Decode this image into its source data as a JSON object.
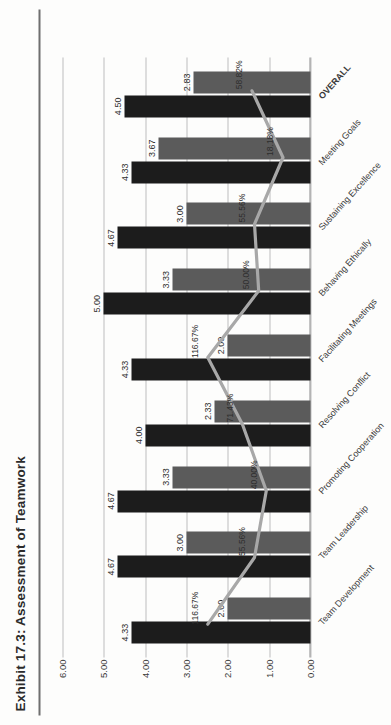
{
  "title": "Exhibit 17.3:  Assessment of Teamwork",
  "axis": {
    "y_ticks": [
      "6.00",
      "5.00",
      "4.00",
      "3.00",
      "2.00",
      "1.00",
      "0.00"
    ]
  },
  "colors": {
    "series_dark": "#1c1c1c",
    "series_mid": "#5b5b5b",
    "line": "#a8a8a8",
    "grid": "#bdbdbd",
    "axis": "#8c8c8c",
    "text": "#2e2e2e",
    "rule": "#6f6f6f",
    "background": "#fdfdfc"
  },
  "chart_data": {
    "type": "bar",
    "title": "Exhibit 17.3:  Assessment of Teamwork",
    "xlabel": "",
    "ylabel": "",
    "ylim": [
      0,
      6
    ],
    "grid": true,
    "legend": "none",
    "categories": [
      "Team Development",
      "Team Leadership",
      "Promoting Cooperation",
      "Resolving Conflict",
      "Facilitating Meetings",
      "Behaving Ethically",
      "Sustaining Excellence",
      "Meeting Goals",
      "OVERALL"
    ],
    "series": [
      {
        "name": "dark-bars",
        "color": "#1c1c1c",
        "values": [
          4.33,
          4.67,
          4.67,
          4.0,
          4.33,
          5.0,
          4.67,
          4.33,
          4.5
        ],
        "labels": [
          "4.33",
          "4.67",
          "4.67",
          "4.00",
          "4.33",
          "5.00",
          "4.67",
          "4.33",
          "4.50"
        ]
      },
      {
        "name": "mid-bars",
        "color": "#5b5b5b",
        "values": [
          2.0,
          3.0,
          3.33,
          2.33,
          2.0,
          3.33,
          3.0,
          3.67,
          2.83
        ],
        "labels": [
          "2.00",
          "3.00",
          "3.33",
          "2.33",
          "2.00",
          "3.33",
          "3.00",
          "3.67",
          "2.83"
        ]
      }
    ],
    "line_series": {
      "name": "percent-line",
      "color": "#a8a8a8",
      "values": [
        116.67,
        55.56,
        40.0,
        71.43,
        116.67,
        50.0,
        55.56,
        18.18,
        58.82
      ],
      "labels": [
        "116.67%",
        "55.56%",
        "40.00%",
        "71.43%",
        "116.67%",
        "50.00%",
        "55.56%",
        "18.18%",
        "58.82%"
      ]
    }
  }
}
